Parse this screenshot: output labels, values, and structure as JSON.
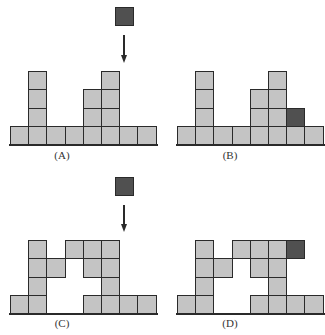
{
  "figure": {
    "cell_size": 18.2,
    "colors": {
      "block": "#c4c4c4",
      "active_block": "#505050",
      "border": "#2a2a2a"
    },
    "panels": [
      {
        "id": "A",
        "label": "(A)",
        "origin_x": 10,
        "baseline_y": 144,
        "label_x": 62,
        "label_y": 149,
        "width_cols": 8,
        "cells": [
          [
            0,
            0
          ],
          [
            1,
            0
          ],
          [
            2,
            0
          ],
          [
            3,
            0
          ],
          [
            4,
            0
          ],
          [
            5,
            0
          ],
          [
            6,
            0
          ],
          [
            7,
            0
          ],
          [
            1,
            1
          ],
          [
            1,
            2
          ],
          [
            1,
            3
          ],
          [
            4,
            1
          ],
          [
            4,
            2
          ],
          [
            5,
            1
          ],
          [
            5,
            2
          ],
          [
            5,
            3
          ]
        ],
        "dark_cells": [],
        "falling_block": {
          "x": 115,
          "y": 7
        },
        "arrow": {
          "x": 124,
          "y1": 35,
          "y2": 63
        }
      },
      {
        "id": "B",
        "label": "(B)",
        "origin_x": 177,
        "baseline_y": 144,
        "label_x": 230,
        "label_y": 149,
        "width_cols": 8,
        "cells": [
          [
            0,
            0
          ],
          [
            1,
            0
          ],
          [
            2,
            0
          ],
          [
            3,
            0
          ],
          [
            4,
            0
          ],
          [
            5,
            0
          ],
          [
            6,
            0
          ],
          [
            7,
            0
          ],
          [
            1,
            1
          ],
          [
            1,
            2
          ],
          [
            1,
            3
          ],
          [
            4,
            1
          ],
          [
            4,
            2
          ],
          [
            5,
            1
          ],
          [
            5,
            2
          ],
          [
            5,
            3
          ]
        ],
        "dark_cells": [
          [
            6,
            1
          ]
        ],
        "falling_block": null,
        "arrow": null
      },
      {
        "id": "C",
        "label": "(C)",
        "origin_x": 10,
        "baseline_y": 313,
        "label_x": 62,
        "label_y": 317,
        "width_cols": 8,
        "cells": [
          [
            0,
            0
          ],
          [
            1,
            0
          ],
          [
            4,
            0
          ],
          [
            5,
            0
          ],
          [
            6,
            0
          ],
          [
            7,
            0
          ],
          [
            1,
            1
          ],
          [
            5,
            1
          ],
          [
            1,
            2
          ],
          [
            2,
            2
          ],
          [
            4,
            2
          ],
          [
            5,
            2
          ],
          [
            1,
            3
          ],
          [
            3,
            3
          ],
          [
            4,
            3
          ],
          [
            5,
            3
          ]
        ],
        "dark_cells": [],
        "falling_block": {
          "x": 115,
          "y": 177
        },
        "arrow": {
          "x": 124,
          "y1": 205,
          "y2": 232
        }
      },
      {
        "id": "D",
        "label": "(D)",
        "origin_x": 177,
        "baseline_y": 313,
        "label_x": 230,
        "label_y": 317,
        "width_cols": 8,
        "cells": [
          [
            0,
            0
          ],
          [
            1,
            0
          ],
          [
            4,
            0
          ],
          [
            5,
            0
          ],
          [
            6,
            0
          ],
          [
            7,
            0
          ],
          [
            1,
            1
          ],
          [
            5,
            1
          ],
          [
            1,
            2
          ],
          [
            2,
            2
          ],
          [
            4,
            2
          ],
          [
            5,
            2
          ],
          [
            1,
            3
          ],
          [
            3,
            3
          ],
          [
            4,
            3
          ],
          [
            5,
            3
          ]
        ],
        "dark_cells": [
          [
            6,
            3
          ]
        ],
        "falling_block": null,
        "arrow": null
      }
    ]
  }
}
